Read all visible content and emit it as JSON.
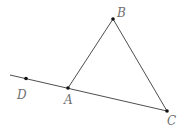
{
  "diagram": {
    "type": "geometry",
    "stroke_color": "#3a3a3a",
    "point_color": "#111111",
    "label_color": "#707070",
    "points": [
      {
        "name": "A",
        "x": 68,
        "y": 88,
        "label_x": 64,
        "label_y": 104
      },
      {
        "name": "B",
        "x": 113,
        "y": 19,
        "label_x": 117,
        "label_y": 17
      },
      {
        "name": "C",
        "x": 167,
        "y": 111,
        "label_x": 167,
        "label_y": 125
      },
      {
        "name": "D",
        "x": 26,
        "y": 78.5,
        "label_x": 17,
        "label_y": 99
      }
    ],
    "segments": [
      {
        "from": "A",
        "to": "B"
      },
      {
        "from": "B",
        "to": "C"
      },
      {
        "from": "line_start",
        "to": "C",
        "start_x": 10,
        "start_y": 75,
        "note": "line through D, A, C"
      }
    ],
    "labels": {
      "A": "A",
      "B": "B",
      "C": "C",
      "D": "D"
    }
  }
}
